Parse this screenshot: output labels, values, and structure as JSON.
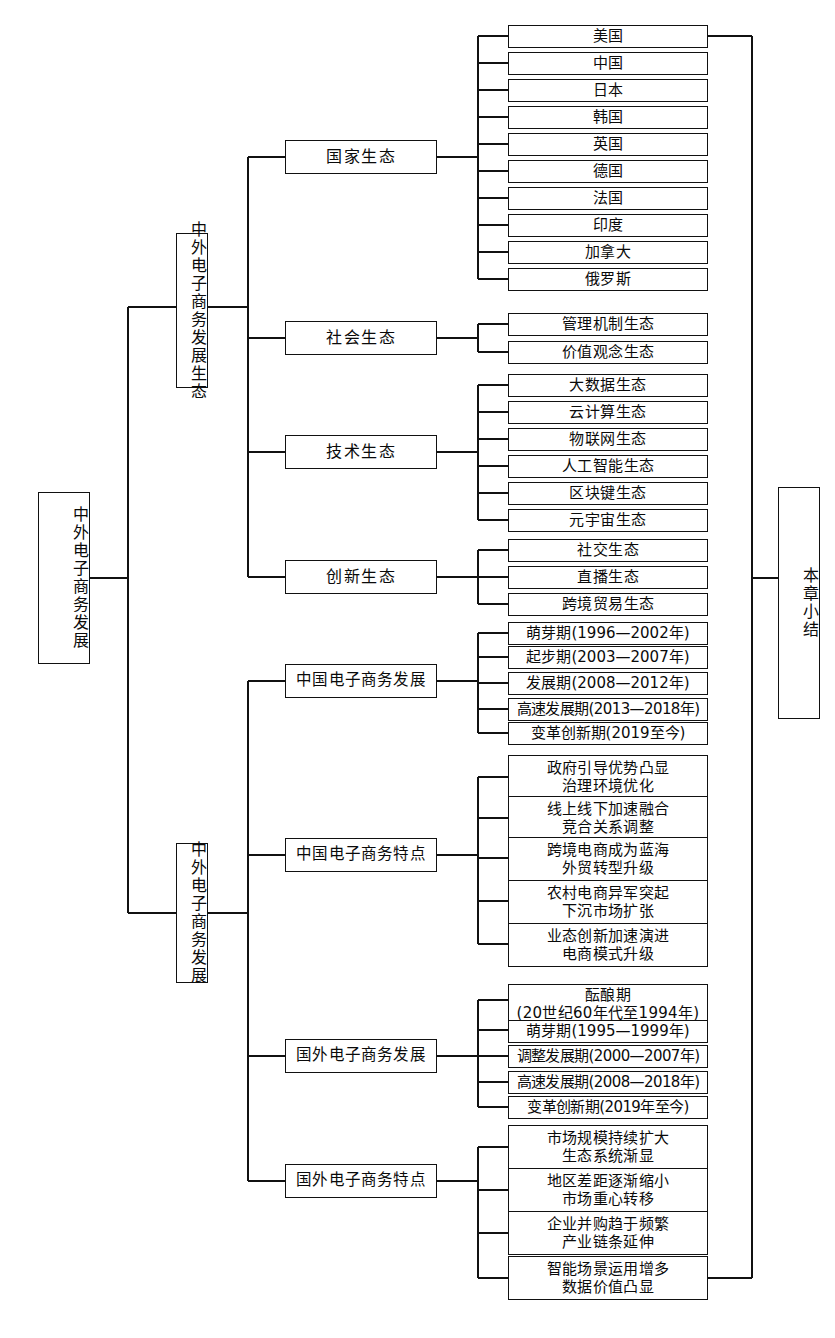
{
  "diagram": {
    "type": "tree-structure-chart",
    "orientation": "left-to-right",
    "root": {
      "label": "中外电子商务发展",
      "vertical": true
    },
    "summary": {
      "label": "本章小结",
      "vertical": true
    },
    "branches": [
      {
        "label": "中外电子商务发展生态",
        "vertical": true,
        "children": [
          {
            "label": "国家生态",
            "leaves": [
              "美国",
              "中国",
              "日本",
              "韩国",
              "英国",
              "德国",
              "法国",
              "印度",
              "加拿大",
              "俄罗斯"
            ]
          },
          {
            "label": "社会生态",
            "leaves": [
              "管理机制生态",
              "价值观念生态"
            ]
          },
          {
            "label": "技术生态",
            "leaves": [
              "大数据生态",
              "云计算生态",
              "物联网生态",
              "人工智能生态",
              "区块键生态",
              "元宇宙生态"
            ]
          },
          {
            "label": "创新生态",
            "leaves": [
              "社交生态",
              "直播生态",
              "跨境贸易生态"
            ]
          }
        ]
      },
      {
        "label": "中外电子商务发展",
        "vertical": true,
        "children": [
          {
            "label": "中国电子商务发展",
            "leaves": [
              "萌芽期(1996—2002年)",
              "起步期(2003—2007年)",
              "发展期(2008—2012年)",
              "高速发展期(2013—2018年)",
              "变革创新期(2019至今)"
            ]
          },
          {
            "label": "中国电子商务特点",
            "leaves": [
              "政府引导优势凸显\n治理环境优化",
              "线上线下加速融合\n竞合关系调整",
              "跨境电商成为蓝海\n外贸转型升级",
              "农村电商异军突起\n下沉市场扩张",
              "业态创新加速演进\n电商模式升级"
            ]
          },
          {
            "label": "国外电子商务发展",
            "leaves": [
              "酝酿期\n(20世纪60年代至1994年)",
              "萌芽期(1995—1999年)",
              "调整发展期(2000—2007年)",
              "高速发展期(2008—2018年)",
              "变革创新期(2019年至今)"
            ]
          },
          {
            "label": "国外电子商务特点",
            "leaves": [
              "市场规模持续扩大\n生态系统渐显",
              "地区差距逐渐缩小\n市场重心转移",
              "企业并购趋于频繁\n产业链条延伸",
              "智能场景运用增多\n数据价值凸显"
            ]
          }
        ]
      }
    ]
  },
  "nodes": {
    "root": "中外电子商务发展",
    "summary": "本章小结",
    "b1": "中外电子商务发展生态",
    "b2": "中外电子商务发展",
    "m1": "国家生态",
    "m2": "社会生态",
    "m3": "技术生态",
    "m4": "创新生态",
    "m5": "中国电子商务发展",
    "m6": "中国电子商务特点",
    "m7": "国外电子商务发展",
    "m8": "国外电子商务特点",
    "c1": "美国",
    "c2": "中国",
    "c3": "日本",
    "c4": "韩国",
    "c5": "英国",
    "c6": "德国",
    "c7": "法国",
    "c8": "印度",
    "c9": "加拿大",
    "c10": "俄罗斯",
    "s1": "管理机制生态",
    "s2": "价值观念生态",
    "t1": "大数据生态",
    "t2": "云计算生态",
    "t3": "物联网生态",
    "t4": "人工智能生态",
    "t5": "区块键生态",
    "t6": "元宇宙生态",
    "i1": "社交生态",
    "i2": "直播生态",
    "i3": "跨境贸易生态",
    "cn1": "萌芽期(1996—2002年)",
    "cn2": "起步期(2003—2007年)",
    "cn3": "发展期(2008—2012年)",
    "cn4": "高速发展期(2013—2018年)",
    "cn5": "变革创新期(2019至今)",
    "cf1a": "政府引导优势凸显",
    "cf1b": "治理环境优化",
    "cf2a": "线上线下加速融合",
    "cf2b": "竞合关系调整",
    "cf3a": "跨境电商成为蓝海",
    "cf3b": "外贸转型升级",
    "cf4a": "农村电商异军突起",
    "cf4b": "下沉市场扩张",
    "cf5a": "业态创新加速演进",
    "cf5b": "电商模式升级",
    "fo1a": "酝酿期",
    "fo1b": "(20世纪60年代至1994年)",
    "fo2": "萌芽期(1995—1999年)",
    "fo3": "调整发展期(2000—2007年)",
    "fo4": "高速发展期(2008—2018年)",
    "fo5": "变革创新期(2019年至今)",
    "ff1a": "市场规模持续扩大",
    "ff1b": "生态系统渐显",
    "ff2a": "地区差距逐渐缩小",
    "ff2b": "市场重心转移",
    "ff3a": "企业并购趋于频繁",
    "ff3b": "产业链条延伸",
    "ff4a": "智能场景运用增多",
    "ff4b": "数据价值凸显"
  }
}
